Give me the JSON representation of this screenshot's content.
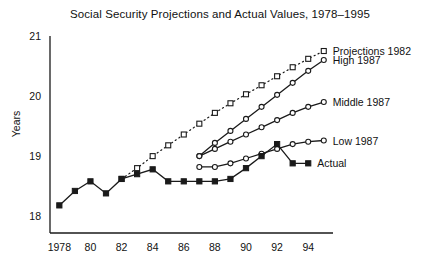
{
  "chart_data": {
    "type": "line",
    "title": "Social Security Projections and Actual Values, 1978–1995",
    "xlabel": "",
    "ylabel": "Years",
    "xlim": [
      1977.4,
      1995.4
    ],
    "ylim": [
      17.72,
      21.0
    ],
    "grid": false,
    "legend_position": "inline-right",
    "yticks": [
      18,
      19,
      20,
      21
    ],
    "ytick_labels": [
      "18",
      "19",
      "20",
      "21"
    ],
    "xticks": [
      1978,
      1980,
      1982,
      1984,
      1986,
      1988,
      1990,
      1992,
      1994
    ],
    "xtick_labels": [
      "1978",
      "80",
      "82",
      "84",
      "86",
      "88",
      "90",
      "92",
      "94"
    ],
    "series": [
      {
        "name": "Projections 1982",
        "marker": "open-square",
        "line": "dotted",
        "color": "#1a1a1a",
        "x": [
          1982,
          1983,
          1984,
          1985,
          1986,
          1987,
          1988,
          1989,
          1990,
          1991,
          1992,
          1993,
          1994,
          1995
        ],
        "values": [
          18.62,
          18.8,
          19.0,
          19.18,
          19.36,
          19.54,
          19.72,
          19.88,
          20.03,
          20.18,
          20.33,
          20.48,
          20.62,
          20.75
        ]
      },
      {
        "name": "High 1987",
        "marker": "open-circle",
        "line": "solid",
        "color": "#1a1a1a",
        "x": [
          1987,
          1988,
          1989,
          1990,
          1991,
          1992,
          1993,
          1994,
          1995
        ],
        "values": [
          19.0,
          19.22,
          19.42,
          19.62,
          19.82,
          20.02,
          20.22,
          20.42,
          20.6
        ]
      },
      {
        "name": "Middle 1987",
        "marker": "open-circle",
        "line": "solid",
        "color": "#1a1a1a",
        "x": [
          1987,
          1988,
          1989,
          1990,
          1991,
          1992,
          1993,
          1994,
          1995
        ],
        "values": [
          19.0,
          19.12,
          19.24,
          19.36,
          19.48,
          19.6,
          19.72,
          19.82,
          19.9
        ]
      },
      {
        "name": "Low 1987",
        "marker": "open-circle",
        "line": "solid",
        "color": "#1a1a1a",
        "x": [
          1987,
          1988,
          1989,
          1990,
          1991,
          1992,
          1993,
          1994,
          1995
        ],
        "values": [
          18.82,
          18.82,
          18.88,
          18.96,
          19.04,
          19.12,
          19.2,
          19.24,
          19.26
        ]
      },
      {
        "name": "Actual",
        "marker": "filled-square",
        "line": "solid",
        "color": "#1a1a1a",
        "x": [
          1978,
          1979,
          1980,
          1981,
          1982,
          1983,
          1984,
          1985,
          1986,
          1987,
          1988,
          1989,
          1990,
          1991,
          1992,
          1993,
          1994
        ],
        "values": [
          18.18,
          18.42,
          18.58,
          18.38,
          18.62,
          18.7,
          18.78,
          18.58,
          18.58,
          18.58,
          18.58,
          18.62,
          18.8,
          19.0,
          19.2,
          18.88,
          18.88
        ]
      }
    ],
    "series_labels": [
      {
        "text": "Projections 1982",
        "at_x": 1995,
        "at_y": 20.75
      },
      {
        "text": "High 1987",
        "at_x": 1995,
        "at_y": 20.6
      },
      {
        "text": "Middle 1987",
        "at_x": 1995,
        "at_y": 19.9
      },
      {
        "text": "Low 1987",
        "at_x": 1995,
        "at_y": 19.26
      },
      {
        "text": "Actual",
        "at_x": 1994,
        "at_y": 18.88
      }
    ]
  }
}
